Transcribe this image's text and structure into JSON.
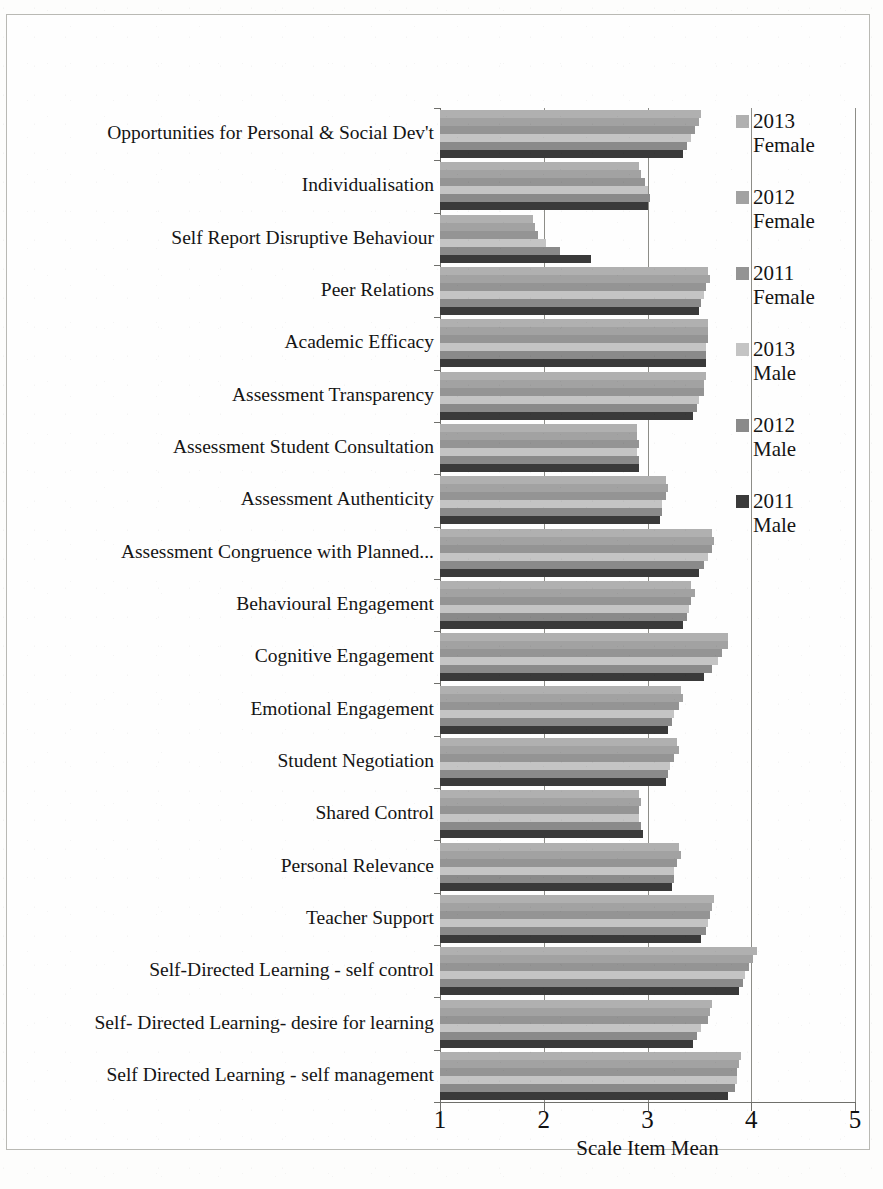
{
  "chart_data": {
    "type": "bar",
    "orientation": "horizontal",
    "title": "",
    "xlabel": "Scale Item Mean",
    "ylabel": "",
    "xlim": [
      1,
      5
    ],
    "xticks": [
      "1",
      "2",
      "3",
      "4",
      "5"
    ],
    "grid": true,
    "legend_position": "right",
    "categories": [
      "Opportunities for Personal & Social Dev't",
      "Individualisation",
      "Self Report Disruptive Behaviour",
      "Peer Relations",
      "Academic Efficacy",
      "Assessment Transparency",
      "Assessment Student Consultation",
      "Assessment Authenticity",
      "Assessment Congruence with Planned...",
      "Behavioural Engagement",
      "Cognitive Engagement",
      "Emotional Engagement",
      "Student Negotiation",
      "Shared Control",
      "Personal Relevance",
      "Teacher Support",
      "Self-Directed Learning - self control",
      "Self- Directed Learning- desire for learning",
      "Self Directed Learning - self management"
    ],
    "series": [
      {
        "name": "2013 Female",
        "color": "#b0b0b0",
        "values": [
          3.52,
          2.92,
          1.9,
          3.58,
          3.58,
          3.56,
          2.9,
          3.18,
          3.62,
          3.42,
          3.78,
          3.32,
          3.28,
          2.92,
          3.3,
          3.64,
          4.06,
          3.62,
          3.9
        ]
      },
      {
        "name": "2012 Female",
        "color": "#a2a2a2",
        "values": [
          3.5,
          2.94,
          1.92,
          3.6,
          3.58,
          3.54,
          2.9,
          3.2,
          3.64,
          3.46,
          3.78,
          3.34,
          3.3,
          2.94,
          3.32,
          3.62,
          4.02,
          3.6,
          3.88
        ]
      },
      {
        "name": "2011 Female",
        "color": "#949494",
        "values": [
          3.46,
          2.98,
          1.94,
          3.56,
          3.58,
          3.54,
          2.92,
          3.18,
          3.62,
          3.42,
          3.72,
          3.3,
          3.26,
          2.92,
          3.28,
          3.6,
          3.98,
          3.58,
          3.86
        ]
      },
      {
        "name": "2013 Male",
        "color": "#c4c4c4",
        "values": [
          3.42,
          3.0,
          2.02,
          3.54,
          3.56,
          3.5,
          2.9,
          3.14,
          3.58,
          3.4,
          3.68,
          3.26,
          3.22,
          2.92,
          3.26,
          3.58,
          3.94,
          3.52,
          3.86
        ]
      },
      {
        "name": "2012 Male",
        "color": "#8a8a8a",
        "values": [
          3.38,
          3.02,
          2.16,
          3.52,
          3.56,
          3.48,
          2.92,
          3.14,
          3.54,
          3.38,
          3.62,
          3.24,
          3.2,
          2.94,
          3.26,
          3.56,
          3.92,
          3.48,
          3.84
        ]
      },
      {
        "name": "2011 Male",
        "color": "#3a3a3a",
        "values": [
          3.34,
          3.0,
          2.46,
          3.5,
          3.56,
          3.44,
          2.92,
          3.12,
          3.5,
          3.34,
          3.54,
          3.2,
          3.18,
          2.96,
          3.24,
          3.52,
          3.88,
          3.44,
          3.78
        ]
      }
    ]
  },
  "legend": {
    "items": [
      {
        "label": "2013\nFemale",
        "color": "#b0b0b0"
      },
      {
        "label": "2012\nFemale",
        "color": "#a2a2a2"
      },
      {
        "label": "2011\nFemale",
        "color": "#949494"
      },
      {
        "label": "2013\nMale",
        "color": "#c4c4c4"
      },
      {
        "label": "2012\nMale",
        "color": "#8a8a8a"
      },
      {
        "label": "2011\nMale",
        "color": "#3a3a3a"
      }
    ]
  },
  "axis": {
    "x_title": "Scale Item Mean",
    "x_tick_labels": [
      "1",
      "2",
      "3",
      "4",
      "5"
    ]
  }
}
